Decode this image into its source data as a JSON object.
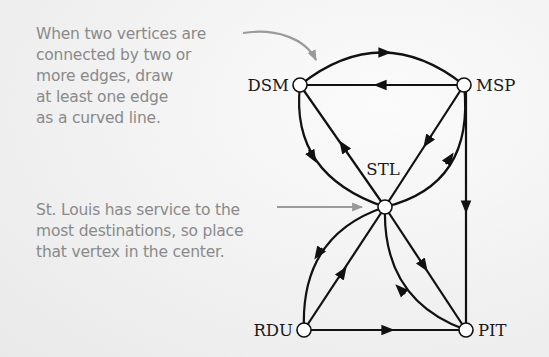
{
  "annotations": {
    "curved_edges_note": "When two vertices are\nconnected by two or\nmore edges, draw\nat least one edge\nas a curved line.",
    "center_vertex_note": "St. Louis has service to the\nmost destinations, so place\nthat vertex in the center."
  },
  "graph": {
    "vertices": [
      {
        "id": "DSM",
        "label": "DSM",
        "x": 300,
        "y": 85
      },
      {
        "id": "MSP",
        "label": "MSP",
        "x": 464,
        "y": 85
      },
      {
        "id": "STL",
        "label": "STL",
        "x": 385,
        "y": 207
      },
      {
        "id": "RDU",
        "label": "RDU",
        "x": 304,
        "y": 330
      },
      {
        "id": "PIT",
        "label": "PIT",
        "x": 466,
        "y": 330
      }
    ],
    "edges": [
      {
        "from": "DSM",
        "to": "MSP",
        "style": "curved"
      },
      {
        "from": "MSP",
        "to": "DSM",
        "style": "straight"
      },
      {
        "from": "DSM",
        "to": "STL",
        "style": "curved"
      },
      {
        "from": "STL",
        "to": "DSM",
        "style": "straight"
      },
      {
        "from": "MSP",
        "to": "STL",
        "style": "straight"
      },
      {
        "from": "STL",
        "to": "MSP",
        "style": "curved"
      },
      {
        "from": "MSP",
        "to": "PIT",
        "style": "straight"
      },
      {
        "from": "STL",
        "to": "RDU",
        "style": "curved"
      },
      {
        "from": "RDU",
        "to": "STL",
        "style": "straight"
      },
      {
        "from": "STL",
        "to": "PIT",
        "style": "straight"
      },
      {
        "from": "PIT",
        "to": "STL",
        "style": "curved"
      },
      {
        "from": "RDU",
        "to": "PIT",
        "style": "straight"
      }
    ]
  },
  "colors": {
    "edge": "#111111",
    "annotation": "#8a8a8a",
    "node_fill": "#ffffff"
  }
}
